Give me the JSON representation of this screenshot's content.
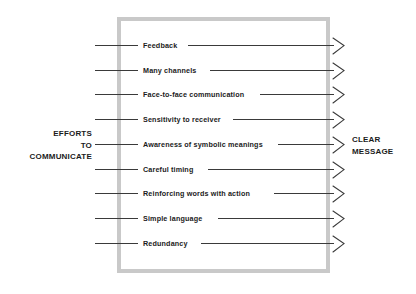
{
  "diagram": {
    "title_left": "EFFORTS\nTO\nCOMMUNICATE",
    "title_right": "CLEAR\nMESSAGE",
    "box": {
      "border_color": "#c9c9c9"
    },
    "line_color": "#3a3a3a",
    "text_color": "#1b1b1b",
    "background_color": "#ffffff",
    "arrow_icon_name": "chevron-right-arrowhead",
    "rows": [
      {
        "label": "Feedback",
        "label_left": 143,
        "label_width": 40
      },
      {
        "label": "Many channels",
        "label_left": 143,
        "label_width": 62
      },
      {
        "label": "Face-to-face communication",
        "label_left": 143,
        "label_width": 112
      },
      {
        "label": "Sensitivity to receiver",
        "label_left": 143,
        "label_width": 85
      },
      {
        "label": "Awareness of symbolic meanings",
        "label_left": 143,
        "label_width": 130
      },
      {
        "label": "Careful timing",
        "label_left": 143,
        "label_width": 60
      },
      {
        "label": "Reinforcing words with action",
        "label_left": 143,
        "label_width": 126
      },
      {
        "label": "Simple language",
        "label_left": 143,
        "label_width": 70
      },
      {
        "label": "Redundancy",
        "label_left": 143,
        "label_width": 53
      }
    ]
  }
}
